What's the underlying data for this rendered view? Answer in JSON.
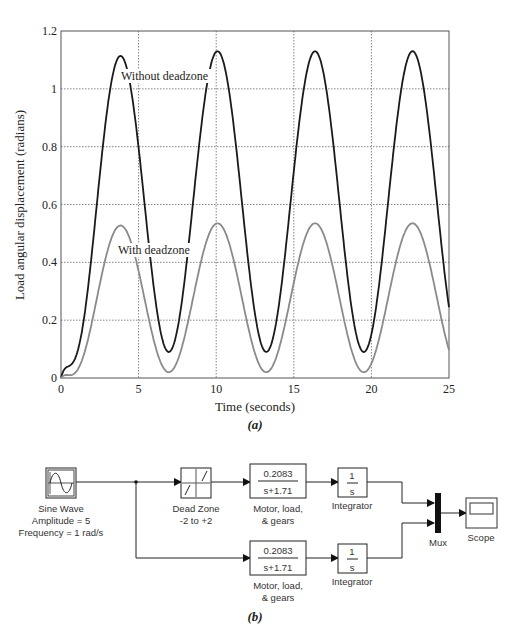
{
  "figure_a": {
    "caption": "(a)",
    "annotations": {
      "without": "Without deadzone",
      "with": "With deadzone"
    }
  },
  "figure_b": {
    "caption": "(b)",
    "blocks": {
      "sine": {
        "label1": "Sine Wave",
        "label2": "Amplitude = 5",
        "label3": "Frequency = 1 rad/s"
      },
      "deadzone": {
        "label1": "Dead Zone",
        "label2": "-2 to +2"
      },
      "tf_top": {
        "num": "0.2083",
        "den": "s+1.71",
        "label1": "Motor, load,",
        "label2": "& gears"
      },
      "tf_bottom": {
        "num": "0.2083",
        "den": "s+1.71",
        "label1": "Motor, load,",
        "label2": "& gears"
      },
      "int_top": {
        "num": "1",
        "den": "s",
        "label": "Integrator"
      },
      "int_bottom": {
        "num": "1",
        "den": "s",
        "label": "Integrator"
      },
      "mux": {
        "label": "Mux"
      },
      "scope": {
        "label": "Scope"
      }
    }
  },
  "chart_data": {
    "type": "line",
    "title": "",
    "xlabel": "Time (seconds)",
    "ylabel": "Load angular displacement (radians)",
    "xlim": [
      0,
      25
    ],
    "ylim": [
      0,
      1.2
    ],
    "xticks": [
      "0",
      "5",
      "10",
      "15",
      "20",
      "25"
    ],
    "yticks": [
      "0",
      "0.2",
      "0.4",
      "0.6",
      "0.8",
      "1",
      "1.2"
    ],
    "grid": true,
    "legend": "inline annotations",
    "series": [
      {
        "name": "Without deadzone",
        "color": "#1a1a1a",
        "description": "oscillation ~ period 2π s, peaks ≈1.13, troughs ≈0.09",
        "x": [
          0,
          1,
          2,
          3,
          3.8,
          5,
          6,
          7,
          8,
          9,
          10.1,
          11,
          12,
          13.3,
          14,
          15,
          16.3,
          17,
          18,
          19.5,
          20.5,
          21.5,
          22.6,
          23.5,
          25
        ],
        "y": [
          0,
          0.15,
          0.6,
          1.0,
          1.13,
          0.95,
          0.45,
          0.09,
          0.35,
          0.85,
          1.13,
          0.98,
          0.5,
          0.09,
          0.2,
          0.6,
          1.13,
          1.02,
          0.6,
          0.09,
          0.3,
          0.8,
          1.13,
          0.98,
          0.21
        ]
      },
      {
        "name": "With deadzone",
        "color": "#808080",
        "description": "oscillation ~ period 2π s, peaks ≈0.535, troughs ≈0.02",
        "x": [
          0,
          1,
          2,
          3,
          3.8,
          5,
          6,
          7,
          8,
          9,
          10,
          11,
          12,
          13.3,
          14,
          15,
          16.3,
          17,
          18,
          19.6,
          20.5,
          21.5,
          22.6,
          23.5,
          25
        ],
        "y": [
          0,
          0.05,
          0.25,
          0.47,
          0.535,
          0.42,
          0.18,
          0.02,
          0.12,
          0.38,
          0.535,
          0.45,
          0.22,
          0.02,
          0.08,
          0.3,
          0.535,
          0.48,
          0.28,
          0.02,
          0.12,
          0.38,
          0.535,
          0.45,
          0.08
        ]
      }
    ]
  }
}
